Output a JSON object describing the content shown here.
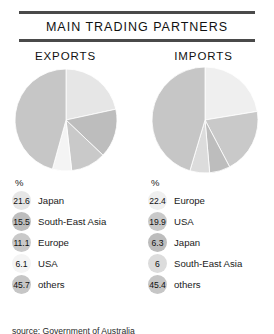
{
  "header": {
    "title": "MAIN TRADING PARTNERS"
  },
  "footer": {
    "source": "source: Government of Australia"
  },
  "percent_symbol": "%",
  "palette": {
    "very_light": "#f2f2f2",
    "light": "#e3e3e3",
    "mid_light": "#d6d6d6",
    "mid": "#c9c9c9",
    "mid_dark": "#bdbdbd",
    "dark": "#b0b0b0",
    "rule": "#4a4a4a",
    "text": "#1a1a1a"
  },
  "chart_data": [
    {
      "type": "pie",
      "title": "EXPORTS",
      "unit": "%",
      "categories": [
        "Japan",
        "South-East Asia",
        "Europe",
        "USA",
        "others"
      ],
      "values": [
        21.6,
        15.5,
        11.1,
        6.1,
        45.7
      ],
      "value_labels": [
        "21.6",
        "15.5",
        "11.1",
        "6.1",
        "45.7"
      ],
      "colors": [
        "#e6e6e6",
        "#bdbdbd",
        "#c9c9c9",
        "#f4f4f4",
        "#c6c6c6"
      ],
      "start_angle": 0,
      "direction": "clockwise",
      "legend_position": "below"
    },
    {
      "type": "pie",
      "title": "IMPORTS",
      "unit": "%",
      "categories": [
        "Europe",
        "USA",
        "Japan",
        "South-East Asia",
        "others"
      ],
      "values": [
        22.4,
        19.9,
        6.3,
        6.0,
        45.4
      ],
      "value_labels": [
        "22.4",
        "19.9",
        "6.3",
        "6",
        "45.4"
      ],
      "colors": [
        "#efefef",
        "#c9c9c9",
        "#bdbdbd",
        "#dcdcdc",
        "#c6c6c6"
      ],
      "start_angle": 0,
      "direction": "clockwise",
      "legend_position": "below"
    }
  ]
}
